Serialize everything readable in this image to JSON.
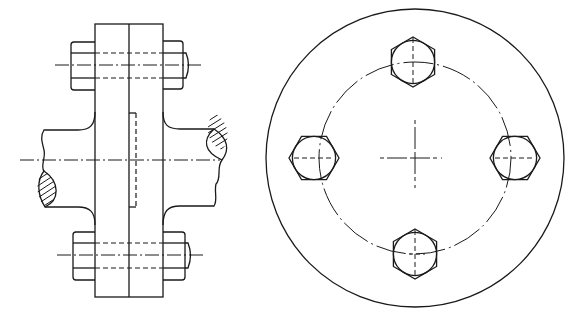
{
  "drawing": {
    "subject": "Bolted flange coupling",
    "views": [
      {
        "id": "side-view",
        "label": "Side view (longitudinal) with two through-bolts"
      },
      {
        "id": "front-view",
        "label": "End view with four bolts on pitch circle"
      }
    ],
    "line_color": "#1a1a1a",
    "background": "#ffffff"
  },
  "side_view": {
    "flange": {
      "x1": 95,
      "x2": 163,
      "split_x": 129,
      "top": 24,
      "bottom": 297
    },
    "axis_y": 160,
    "bolt_axes_y": [
      65,
      255
    ],
    "bolt_count_visible": 2
  },
  "front_view": {
    "center": {
      "x": 415,
      "y": 158
    },
    "outer_radius": 149,
    "pitch_radius": 96,
    "bolt_count": 4,
    "bolt_angles_deg": [
      270,
      0,
      90,
      180
    ],
    "hex_radius": 25
  }
}
